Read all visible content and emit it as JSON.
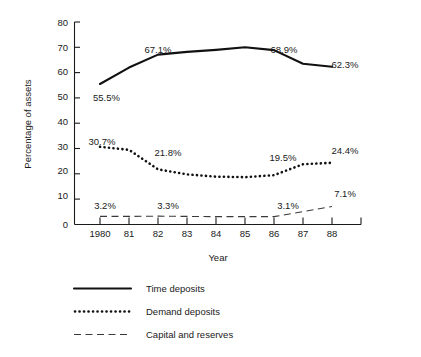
{
  "chart_data": {
    "type": "line",
    "title": "",
    "xlabel": "Year",
    "ylabel": "Percentage of assets",
    "x": [
      1980,
      1981,
      1982,
      1983,
      1984,
      1985,
      1986,
      1987,
      1988
    ],
    "xtick_labels": [
      "1980",
      "81",
      "82",
      "83",
      "84",
      "85",
      "86",
      "87",
      "88"
    ],
    "ytick_labels": [
      "0",
      "10",
      "20",
      "30",
      "40",
      "50",
      "60",
      "70",
      "80"
    ],
    "ylim": [
      0,
      80
    ],
    "ytick_step": 10,
    "grid": false,
    "legend_position": "below",
    "series": [
      {
        "name": "Time deposits",
        "style": "solid",
        "values": [
          55.5,
          62.0,
          67.1,
          68.2,
          69.0,
          70.0,
          68.9,
          63.5,
          62.3
        ],
        "annotations": [
          {
            "x": 1980,
            "value": 55.5,
            "text": "55.5%"
          },
          {
            "x": 1982,
            "value": 67.1,
            "text": "67.1%"
          },
          {
            "x": 1986,
            "value": 68.9,
            "text": "68.9%"
          },
          {
            "x": 1988,
            "value": 62.3,
            "text": "62.3%"
          }
        ]
      },
      {
        "name": "Demand deposits",
        "style": "dotted",
        "values": [
          30.7,
          29.5,
          21.8,
          19.8,
          18.9,
          18.7,
          19.5,
          23.8,
          24.4
        ],
        "annotations": [
          {
            "x": 1980,
            "value": 30.7,
            "text": "30.7%"
          },
          {
            "x": 1982,
            "value": 21.8,
            "text": "21.8%"
          },
          {
            "x": 1986,
            "value": 19.5,
            "text": "19.5%"
          },
          {
            "x": 1988,
            "value": 24.4,
            "text": "24.4%"
          }
        ]
      },
      {
        "name": "Capital and reserves",
        "style": "dashed",
        "values": [
          3.2,
          3.2,
          3.3,
          3.2,
          3.1,
          3.1,
          3.1,
          5.1,
          7.1
        ],
        "annotations": [
          {
            "x": 1980,
            "value": 3.2,
            "text": "3.2%"
          },
          {
            "x": 1982,
            "value": 3.3,
            "text": "3.3%"
          },
          {
            "x": 1986,
            "value": 3.1,
            "text": "3.1%"
          },
          {
            "x": 1988,
            "value": 7.1,
            "text": "7.1%"
          }
        ]
      }
    ]
  },
  "legend": {
    "items": [
      {
        "label": "Time deposits",
        "style": "solid"
      },
      {
        "label": "Demand deposits",
        "style": "dotted"
      },
      {
        "label": "Capital and reserves",
        "style": "dashed"
      }
    ]
  },
  "colors": {
    "ink": "#111111",
    "axis": "#1a1a1a",
    "dashed_ink": "#3a3a3a",
    "background": "#ffffff"
  }
}
